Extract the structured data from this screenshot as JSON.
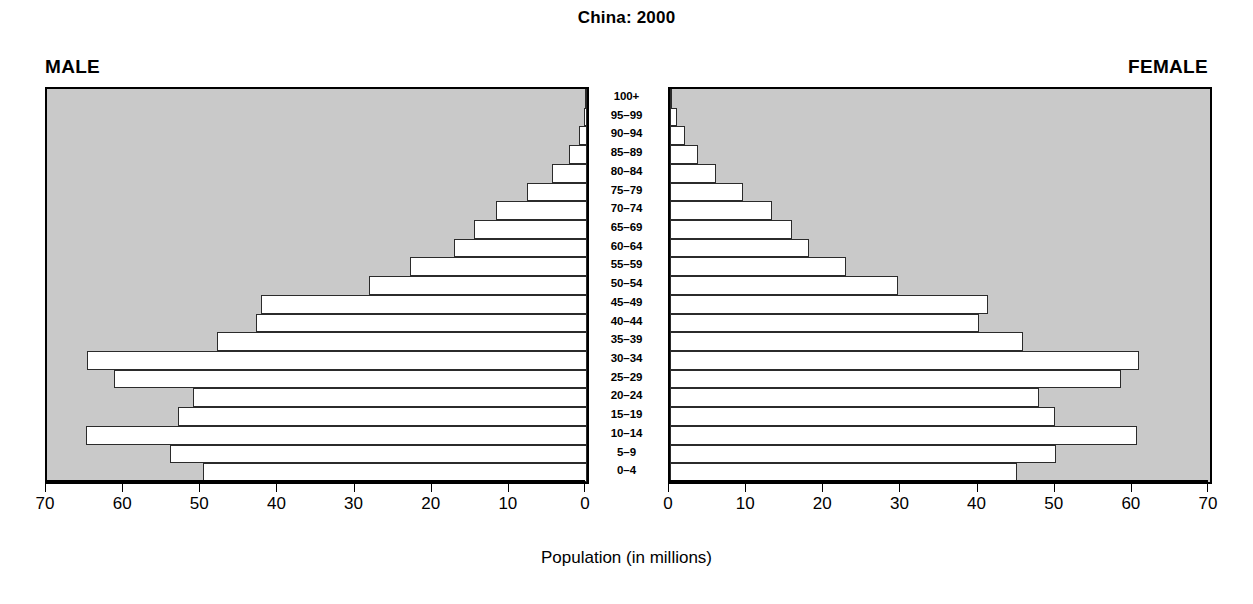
{
  "chart_data": {
    "type": "bar",
    "subtype": "population-pyramid",
    "title": "China: 2000",
    "xlabel": "Population (in millions)",
    "ylabel": "",
    "left_panel_label": "MALE",
    "right_panel_label": "FEMALE",
    "xlim": [
      0,
      70
    ],
    "xticks": [
      0,
      10,
      20,
      30,
      40,
      50,
      60,
      70
    ],
    "left_xticks_order": [
      70,
      60,
      50,
      40,
      30,
      20,
      10,
      0
    ],
    "right_xticks_order": [
      0,
      10,
      20,
      30,
      40,
      50,
      60,
      70
    ],
    "grid": false,
    "legend": "none",
    "plot_background": "#c9c9c9",
    "bar_fill": "#ffffff",
    "bar_edge": "#2b2b2b",
    "categories": [
      "100+",
      "95–99",
      "90–94",
      "85–89",
      "80–84",
      "75–79",
      "70–74",
      "65–69",
      "60–64",
      "55–59",
      "50–54",
      "45–49",
      "40–44",
      "35–39",
      "30–34",
      "25–29",
      "20–24",
      "15–19",
      "10–14",
      "5–9",
      "0–4"
    ],
    "series": [
      {
        "name": "MALE",
        "side": "left",
        "values": [
          0.1,
          0.4,
          1.0,
          2.3,
          4.6,
          7.8,
          11.8,
          14.7,
          17.3,
          22.9,
          28.2,
          42.3,
          42.9,
          48.0,
          64.8,
          61.3,
          51.1,
          53.0,
          65.0,
          54.0,
          49.8
        ]
      },
      {
        "name": "FEMALE",
        "side": "right",
        "values": [
          0.2,
          0.9,
          2.0,
          3.6,
          6.0,
          9.5,
          13.2,
          15.8,
          18.0,
          22.8,
          29.6,
          41.2,
          40.0,
          45.8,
          60.8,
          58.4,
          47.8,
          49.9,
          60.6,
          50.0,
          45.0
        ]
      }
    ]
  }
}
